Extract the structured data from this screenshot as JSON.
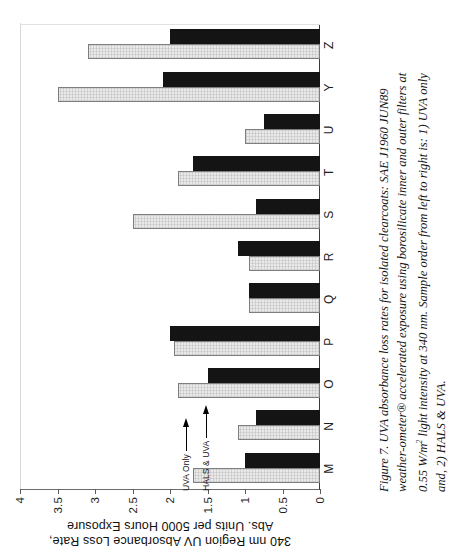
{
  "figure": {
    "caption_line1": "Figure 7. UVA absorbance loss rates for isolated clearcoats: SAE J1960 JUN89",
    "caption_line2": "weather-ometer® accelerated exposure using borosilicate inner and outer filters at",
    "caption_line3a": "0.55 W/m",
    "caption_line3sup": "2",
    "caption_line3b": " light intensity at 340 nm.  Sample order from left to right is:  1) UVA only",
    "caption_line4": "and, 2) HALS & UVA."
  },
  "annotations": {
    "upper_label": "HALS & UVA",
    "lower_label": "UVA Only"
  },
  "chart_data": {
    "type": "bar",
    "title": "",
    "xlabel": "",
    "ylabel": "340 nm Region UV Absorbance Loss Rate, Abs. Units per 5000 Hours Exposure",
    "ylabel_line1": "340 nm Region UV Absorbance Loss Rate,",
    "ylabel_line2": "Abs. Units per 5000 Hours Exposure",
    "ylim": [
      0,
      4
    ],
    "yticks": [
      0,
      0.5,
      1,
      1.5,
      2,
      2.5,
      3,
      3.5,
      4
    ],
    "ytick_labels": [
      "0",
      "0.5",
      "1",
      "1.5",
      "2",
      "2.5",
      "3",
      "3.5",
      "4"
    ],
    "grid": false,
    "legend_position": "inline-annotation",
    "orientation": "vertical-bars-rotated-90ccw",
    "categories": [
      "M",
      "N",
      "O",
      "P",
      "Q",
      "R",
      "S",
      "T",
      "U",
      "Y",
      "Z"
    ],
    "series": [
      {
        "name": "UVA Only",
        "color": "#e9e9e9",
        "values": [
          1.7,
          1.1,
          1.9,
          1.95,
          0.95,
          0.95,
          2.5,
          1.9,
          1.0,
          3.5,
          3.1
        ]
      },
      {
        "name": "HALS & UVA",
        "color": "#141414",
        "values": [
          1.0,
          0.85,
          1.5,
          2.0,
          0.95,
          1.1,
          0.85,
          1.7,
          0.75,
          2.1,
          2.0
        ]
      }
    ]
  }
}
